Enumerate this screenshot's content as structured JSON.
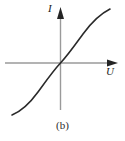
{
  "figure": {
    "caption": "(b)",
    "background_color": "#ffffff",
    "width": 125,
    "height": 141
  },
  "chart_data": {
    "type": "line",
    "title": "(b)",
    "xlabel": "U",
    "ylabel": "I",
    "grid": false,
    "legend": null,
    "axis_style": {
      "axis_color": "#9a9a9a",
      "arrowhead_color": "#222222",
      "curve_color": "#2a2a2a",
      "curve_width": 1.6,
      "x_axis_y": 63,
      "y_axis_x": 60.5,
      "x_axis_from": 5,
      "x_axis_to": 118,
      "y_axis_from": 110,
      "y_axis_to": 8,
      "arrows": [
        "x-right",
        "y-up"
      ]
    },
    "xlim": [
      -55,
      58
    ],
    "ylim": [
      -52,
      55
    ],
    "series": [
      {
        "name": "I(U)",
        "points": [
          [
            -48,
            -52
          ],
          [
            -44,
            -49
          ],
          [
            -40,
            -45
          ],
          [
            -35,
            -40
          ],
          [
            -30,
            -34
          ],
          [
            -25,
            -28
          ],
          [
            -20,
            -22
          ],
          [
            -15,
            -16
          ],
          [
            -10,
            -10
          ],
          [
            -5,
            -5
          ],
          [
            0,
            0
          ],
          [
            5,
            6
          ],
          [
            10,
            12
          ],
          [
            15,
            18
          ],
          [
            20,
            24
          ],
          [
            25,
            30
          ],
          [
            30,
            36
          ],
          [
            35,
            42
          ],
          [
            40,
            47
          ],
          [
            45,
            51
          ],
          [
            50,
            54
          ]
        ]
      }
    ],
    "svg_paths": {
      "curve": "M 12,115 C 22,111 30,103 38,92 C 46,81 53,71 60.5,63 C 68,55 75,45 83,34 C 91,23 100,14 110,9"
    }
  },
  "labels": {
    "y_axis": "I",
    "x_axis": "U"
  }
}
